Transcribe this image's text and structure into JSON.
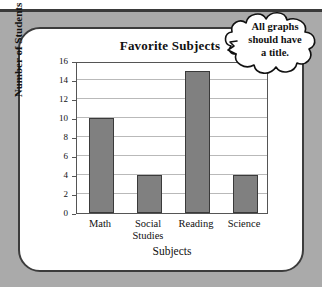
{
  "chart_data": {
    "type": "bar",
    "title": "Favorite Subjects",
    "xlabel": "Subjects",
    "ylabel": "Number of Students",
    "categories": [
      "Math",
      "Social Studies",
      "Reading",
      "Science"
    ],
    "category_lines": [
      [
        "Math"
      ],
      [
        "Social",
        "Studies"
      ],
      [
        "Reading"
      ],
      [
        "Science"
      ]
    ],
    "values": [
      10,
      4,
      15,
      4
    ],
    "ylim": [
      0,
      16
    ],
    "yticks": [
      0,
      2,
      4,
      6,
      8,
      10,
      12,
      14,
      16
    ],
    "ytick_labels": [
      "0",
      "2",
      "4",
      "6",
      "8",
      "10",
      "12",
      "14",
      "16"
    ],
    "grid": true,
    "legend": "none",
    "bar_color": "#808080",
    "bar_edge_color": "#3a3a3a"
  },
  "annotation": {
    "bubble_lines": [
      "All graphs",
      "should have",
      "a title."
    ],
    "bubble_text": "All graphs should have a title.",
    "points_to": "Favorite Subjects"
  },
  "colors": {
    "page_background": "#aaaaaa",
    "card_background": "#ffffff",
    "card_border": "#3c3c3c",
    "gridline": "#b9b9b9",
    "text": "#111111"
  }
}
